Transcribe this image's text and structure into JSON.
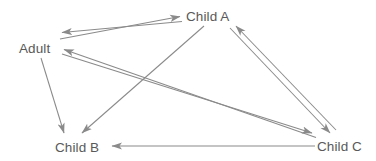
{
  "diagram": {
    "type": "directed-graph",
    "background_color": "#ffffff",
    "edge_color": "#8a8a8a",
    "label_color": "#595959",
    "nodes": [
      {
        "id": "adult",
        "label": "Adult",
        "x": 37,
        "y": 48
      },
      {
        "id": "child_a",
        "label": "Child A",
        "x": 212,
        "y": 16
      },
      {
        "id": "child_b",
        "label": "Child B",
        "x": 78,
        "y": 147
      },
      {
        "id": "child_c",
        "label": "Child C",
        "x": 340,
        "y": 146
      }
    ],
    "edges": [
      {
        "from": "adult",
        "to": "child_a",
        "bidirectional": true,
        "style": "double-line"
      },
      {
        "from": "adult",
        "to": "child_c",
        "bidirectional": true,
        "style": "double-line"
      },
      {
        "from": "child_a",
        "to": "child_c",
        "bidirectional": true,
        "style": "double-line"
      },
      {
        "from": "adult",
        "to": "child_b",
        "bidirectional": false,
        "style": "single-line"
      },
      {
        "from": "child_a",
        "to": "child_b",
        "bidirectional": false,
        "style": "single-line"
      },
      {
        "from": "child_c",
        "to": "child_b",
        "bidirectional": false,
        "style": "single-line"
      }
    ]
  }
}
